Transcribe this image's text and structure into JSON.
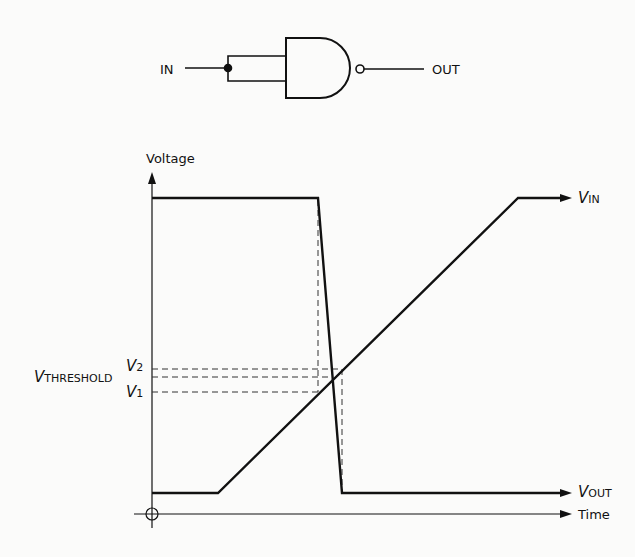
{
  "gate": {
    "type": "NAND",
    "input_label": "IN",
    "output_label": "OUT"
  },
  "axes": {
    "y_label": "Voltage",
    "x_label": "Time"
  },
  "signals": {
    "vin": {
      "symbol": "V",
      "subscript": "IN"
    },
    "vout": {
      "symbol": "V",
      "subscript": "OUT"
    }
  },
  "levels": {
    "v2": {
      "symbol": "V",
      "subscript": "2"
    },
    "vth": {
      "symbol": "V",
      "subscript": "THRESHOLD"
    },
    "v1": {
      "symbol": "V",
      "subscript": "1"
    }
  },
  "colors": {
    "line": "#111111",
    "background": "#fbfbfa"
  }
}
